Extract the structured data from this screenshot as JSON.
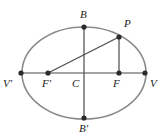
{
  "figure": {
    "type": "ellipse-geometry-diagram",
    "width": 167,
    "height": 140,
    "background_color": "#ffffff",
    "ellipse_stroke_color": "#8a8a8a",
    "line_color": "#4a4a4a",
    "point_color": "#2b2b2b",
    "label_color": "#1a1a1a"
  },
  "ellipse": {
    "center_x": 84,
    "center_y": 73,
    "semi_major_axis": 62,
    "semi_minor_axis": 46,
    "stroke_width": 1.6
  },
  "points": {
    "V_prime": {
      "label": "V'",
      "x": 21,
      "y": 73,
      "label_x": 3,
      "label_y": 78
    },
    "V": {
      "label": "V",
      "x": 145,
      "y": 73,
      "label_x": 150,
      "label_y": 78
    },
    "B": {
      "label": "B",
      "x": 84,
      "y": 27,
      "label_x": 80,
      "label_y": 9
    },
    "B_prime": {
      "label": "B'",
      "x": 84,
      "y": 118,
      "label_x": 79,
      "label_y": 123
    },
    "C": {
      "label": "C",
      "x": 84,
      "y": 73,
      "label_x": 72,
      "label_y": 78
    },
    "F_prime": {
      "label": "F'",
      "x": 48,
      "y": 73,
      "label_x": 42,
      "label_y": 78
    },
    "F": {
      "label": "F",
      "x": 119,
      "y": 73,
      "label_x": 113,
      "label_y": 78
    },
    "P": {
      "label": "P",
      "x": 119,
      "y": 37,
      "label_x": 124,
      "label_y": 18
    }
  },
  "segments": [
    {
      "name": "major-axis",
      "from": "V_prime",
      "to": "V",
      "x1": 21,
      "y1": 73,
      "x2": 145,
      "y2": 73
    },
    {
      "name": "minor-axis",
      "from": "B",
      "to": "B_prime",
      "x1": 84,
      "y1": 27,
      "x2": 84,
      "y2": 118
    },
    {
      "name": "focal-radius-f-prime-p",
      "from": "F_prime",
      "to": "P",
      "x1": 48,
      "y1": 73,
      "x2": 119,
      "y2": 37
    },
    {
      "name": "focal-radius-p-f",
      "from": "P",
      "to": "F",
      "x1": 119,
      "y1": 37,
      "x2": 119,
      "y2": 73
    }
  ],
  "point_radius": 2.6
}
